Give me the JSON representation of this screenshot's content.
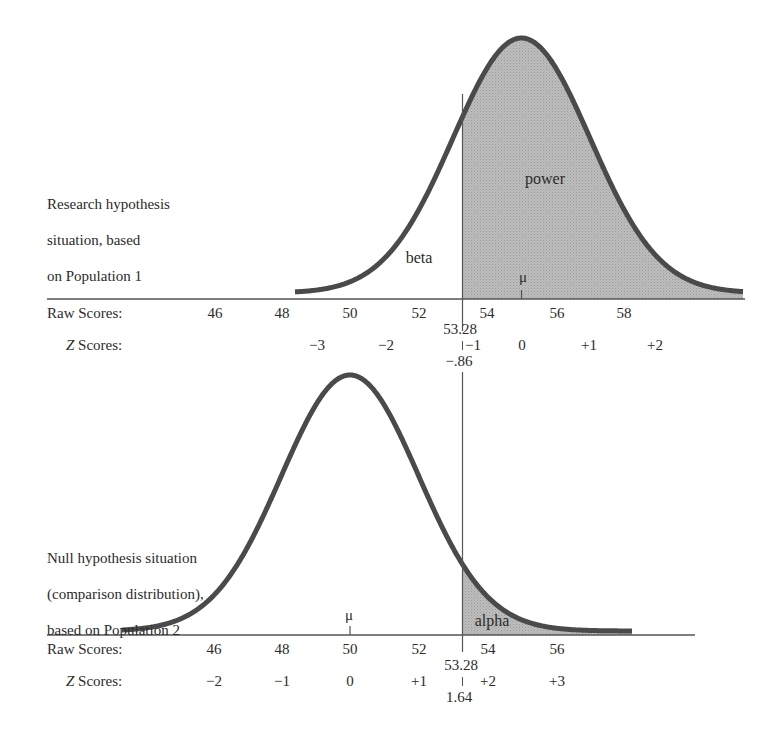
{
  "upper": {
    "description": [
      "Research hypothesis",
      "situation, based",
      "on Population 1"
    ],
    "area_labels": {
      "beta": "beta",
      "power": "power"
    },
    "mean_symbol": "μ",
    "raw_label": "Raw Scores:",
    "z_label": "Z Scores:",
    "raw_ticks": [
      "46",
      "48",
      "50",
      "52",
      "54",
      "56",
      "58"
    ],
    "z_ticks": [
      "−3",
      "−2",
      "−1",
      "0",
      "+1",
      "+2"
    ],
    "cutoff_raw": "53.28",
    "cutoff_z": "−.86"
  },
  "lower": {
    "description": [
      "Null hypothesis situation",
      "(comparison distribution),",
      "based on Population 2"
    ],
    "area_labels": {
      "alpha": "alpha"
    },
    "mean_symbol": "μ",
    "raw_label": "Raw Scores:",
    "z_label": "Z Scores:",
    "raw_ticks": [
      "46",
      "48",
      "50",
      "52",
      "54",
      "56"
    ],
    "z_ticks": [
      "−2",
      "−1",
      "0",
      "+1",
      "+2",
      "+3"
    ],
    "cutoff_raw": "53.28",
    "cutoff_z": "1.64"
  },
  "colors": {
    "curve": "#4a4a4a",
    "shade": "#b4b4b4",
    "axis": "#555555",
    "text": "#2b2b2b"
  },
  "chart_data": {
    "type": "area",
    "title": "",
    "series": [
      {
        "name": "Research hypothesis distribution (Population 1)",
        "mean": 55,
        "sd": 2,
        "shaded_region": {
          "label": "power",
          "from": 53.28,
          "to": 62
        },
        "unshaded_region": {
          "label": "beta",
          "from": 48,
          "to": 53.28
        }
      },
      {
        "name": "Null hypothesis / comparison distribution (Population 2)",
        "mean": 50,
        "sd": 2,
        "shaded_region": {
          "label": "alpha",
          "from": 53.28,
          "to": 57
        }
      }
    ],
    "cutoff": {
      "raw": 53.28,
      "z_upper": -0.86,
      "z_lower": 1.64
    },
    "xlabel": "Raw Scores",
    "ylabel": ""
  }
}
